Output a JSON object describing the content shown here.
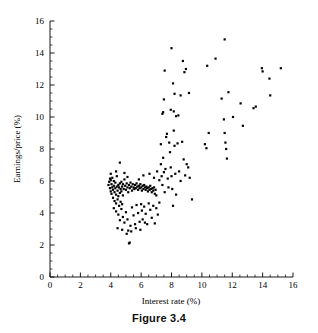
{
  "caption": "Figure 3.4",
  "chart_data": {
    "type": "scatter",
    "title": "",
    "xlabel": "Interest rate (%)",
    "ylabel": "Earnings/price (%)",
    "xlim": [
      0,
      16
    ],
    "ylim": [
      0,
      16
    ],
    "xticks": [
      0,
      2,
      4,
      6,
      8,
      10,
      12,
      14,
      16
    ],
    "yticks": [
      0,
      2,
      4,
      6,
      8,
      10,
      12,
      14,
      16
    ],
    "xtick_labels": [
      "0",
      "2",
      "4",
      "6",
      "8",
      "10",
      "12",
      "14",
      "16"
    ],
    "ytick_labels": [
      "0",
      "2",
      "4",
      "6",
      "8",
      "10",
      "12",
      "14",
      "16"
    ],
    "minor_tick_step": 0.5,
    "grid": false,
    "legend": false,
    "marker": "filled-square",
    "marker_color": "#000000",
    "marker_size_px": 2.2,
    "n_points": 198,
    "points": [
      [
        3.85,
        5.75
      ],
      [
        3.9,
        5.95
      ],
      [
        3.95,
        6.15
      ],
      [
        3.95,
        5.55
      ],
      [
        4.0,
        5.35
      ],
      [
        4.0,
        6.05
      ],
      [
        4.05,
        5.8
      ],
      [
        4.05,
        5.2
      ],
      [
        4.1,
        5.6
      ],
      [
        4.1,
        6.2
      ],
      [
        4.15,
        5.45
      ],
      [
        4.15,
        4.95
      ],
      [
        4.2,
        5.7
      ],
      [
        4.2,
        6.0
      ],
      [
        4.25,
        5.3
      ],
      [
        4.25,
        4.75
      ],
      [
        4.3,
        5.55
      ],
      [
        4.3,
        5.9
      ],
      [
        4.35,
        5.15
      ],
      [
        4.35,
        4.6
      ],
      [
        4.4,
        5.65
      ],
      [
        4.4,
        6.3
      ],
      [
        4.45,
        5.4
      ],
      [
        4.45,
        4.85
      ],
      [
        4.5,
        5.75
      ],
      [
        4.5,
        5.05
      ],
      [
        4.55,
        5.6
      ],
      [
        4.55,
        4.45
      ],
      [
        4.6,
        5.85
      ],
      [
        4.6,
        5.25
      ],
      [
        4.65,
        5.5
      ],
      [
        4.65,
        4.7
      ],
      [
        4.7,
        5.95
      ],
      [
        4.7,
        5.35
      ],
      [
        4.75,
        5.65
      ],
      [
        4.75,
        4.55
      ],
      [
        4.8,
        5.8
      ],
      [
        4.8,
        5.1
      ],
      [
        4.85,
        5.5
      ],
      [
        4.9,
        6.1
      ],
      [
        4.95,
        5.7
      ],
      [
        5.0,
        5.45
      ],
      [
        5.05,
        5.85
      ],
      [
        5.1,
        5.6
      ],
      [
        5.15,
        5.3
      ],
      [
        5.2,
        5.75
      ],
      [
        5.25,
        5.55
      ],
      [
        5.3,
        5.9
      ],
      [
        5.35,
        5.65
      ],
      [
        5.4,
        5.4
      ],
      [
        5.45,
        5.8
      ],
      [
        5.5,
        5.6
      ],
      [
        5.55,
        5.5
      ],
      [
        5.6,
        5.75
      ],
      [
        5.65,
        5.55
      ],
      [
        5.7,
        5.85
      ],
      [
        5.75,
        5.65
      ],
      [
        5.8,
        5.45
      ],
      [
        5.85,
        5.7
      ],
      [
        5.9,
        5.55
      ],
      [
        5.95,
        5.8
      ],
      [
        6.0,
        5.6
      ],
      [
        6.05,
        5.4
      ],
      [
        6.1,
        5.7
      ],
      [
        6.15,
        5.5
      ],
      [
        6.2,
        5.75
      ],
      [
        6.25,
        5.6
      ],
      [
        6.3,
        5.45
      ],
      [
        6.35,
        5.65
      ],
      [
        6.4,
        5.55
      ],
      [
        6.45,
        5.35
      ],
      [
        6.5,
        5.6
      ],
      [
        6.55,
        5.45
      ],
      [
        6.6,
        5.7
      ],
      [
        6.65,
        5.5
      ],
      [
        6.7,
        5.3
      ],
      [
        6.75,
        5.55
      ],
      [
        6.8,
        5.4
      ],
      [
        6.85,
        5.6
      ],
      [
        6.9,
        5.2
      ],
      [
        6.95,
        5.45
      ],
      [
        7.0,
        5.1
      ],
      [
        4.2,
        4.3
      ],
      [
        4.35,
        4.1
      ],
      [
        4.5,
        3.9
      ],
      [
        4.6,
        3.55
      ],
      [
        4.7,
        4.25
      ],
      [
        4.8,
        3.75
      ],
      [
        4.9,
        3.4
      ],
      [
        5.0,
        4.05
      ],
      [
        5.1,
        3.6
      ],
      [
        5.15,
        2.9
      ],
      [
        5.2,
        2.1
      ],
      [
        5.25,
        2.15
      ],
      [
        5.3,
        3.2
      ],
      [
        5.4,
        4.35
      ],
      [
        5.5,
        3.85
      ],
      [
        5.6,
        3.3
      ],
      [
        5.7,
        4.5
      ],
      [
        5.8,
        4.0
      ],
      [
        5.9,
        3.45
      ],
      [
        6.0,
        4.55
      ],
      [
        6.05,
        4.15
      ],
      [
        6.1,
        3.6
      ],
      [
        6.2,
        4.4
      ],
      [
        6.3,
        3.95
      ],
      [
        6.4,
        3.3
      ],
      [
        6.5,
        4.6
      ],
      [
        6.6,
        4.2
      ],
      [
        6.7,
        3.7
      ],
      [
        6.8,
        4.45
      ],
      [
        6.9,
        3.35
      ],
      [
        7.0,
        4.3
      ],
      [
        7.1,
        3.9
      ],
      [
        7.2,
        4.65
      ],
      [
        4.45,
        3.05
      ],
      [
        4.75,
        2.95
      ],
      [
        5.05,
        2.7
      ],
      [
        5.35,
        2.85
      ],
      [
        5.65,
        3.05
      ],
      [
        5.95,
        2.95
      ],
      [
        6.25,
        3.4
      ],
      [
        4.6,
        7.15
      ],
      [
        4.35,
        6.6
      ],
      [
        4.0,
        6.45
      ],
      [
        4.9,
        6.5
      ],
      [
        5.1,
        6.25
      ],
      [
        5.85,
        6.1
      ],
      [
        6.15,
        6.35
      ],
      [
        6.55,
        6.45
      ],
      [
        6.85,
        6.2
      ],
      [
        7.05,
        6.6
      ],
      [
        7.2,
        6.05
      ],
      [
        7.3,
        7.05
      ],
      [
        7.35,
        6.3
      ],
      [
        7.4,
        5.75
      ],
      [
        7.45,
        7.45
      ],
      [
        7.5,
        6.55
      ],
      [
        7.55,
        5.3
      ],
      [
        7.6,
        6.75
      ],
      [
        7.65,
        8.75
      ],
      [
        7.7,
        8.95
      ],
      [
        7.75,
        6.15
      ],
      [
        7.8,
        5.6
      ],
      [
        7.85,
        8.4
      ],
      [
        7.9,
        7.8
      ],
      [
        7.95,
        6.85
      ],
      [
        8.0,
        6.3
      ],
      [
        8.05,
        5.5
      ],
      [
        8.1,
        4.45
      ],
      [
        8.15,
        9.15
      ],
      [
        8.2,
        8.2
      ],
      [
        8.25,
        6.45
      ],
      [
        8.3,
        5.15
      ],
      [
        8.4,
        8.35
      ],
      [
        8.5,
        6.6
      ],
      [
        8.6,
        6.0
      ],
      [
        8.7,
        8.45
      ],
      [
        8.8,
        7.35
      ],
      [
        8.9,
        6.35
      ],
      [
        9.0,
        7.05
      ],
      [
        9.1,
        6.85
      ],
      [
        9.2,
        6.2
      ],
      [
        9.35,
        4.85
      ],
      [
        7.3,
        8.3
      ],
      [
        7.4,
        10.2
      ],
      [
        7.45,
        10.3
      ],
      [
        7.5,
        11.1
      ],
      [
        7.55,
        12.9
      ],
      [
        7.95,
        10.45
      ],
      [
        8.0,
        14.3
      ],
      [
        8.1,
        12.1
      ],
      [
        8.15,
        10.35
      ],
      [
        8.2,
        11.45
      ],
      [
        8.3,
        10.05
      ],
      [
        8.45,
        10.1
      ],
      [
        8.6,
        11.35
      ],
      [
        8.75,
        13.5
      ],
      [
        8.85,
        12.8
      ],
      [
        8.95,
        13.0
      ],
      [
        9.15,
        11.5
      ],
      [
        10.2,
        8.3
      ],
      [
        10.3,
        8.05
      ],
      [
        10.35,
        13.2
      ],
      [
        10.45,
        9.0
      ],
      [
        10.9,
        13.65
      ],
      [
        11.3,
        11.15
      ],
      [
        11.45,
        9.85
      ],
      [
        11.5,
        9.0
      ],
      [
        11.55,
        8.4
      ],
      [
        11.6,
        8.0
      ],
      [
        11.65,
        7.4
      ],
      [
        11.5,
        14.85
      ],
      [
        11.75,
        11.55
      ],
      [
        12.05,
        10.0
      ],
      [
        12.55,
        10.85
      ],
      [
        12.7,
        9.45
      ],
      [
        13.4,
        10.55
      ],
      [
        13.55,
        10.65
      ],
      [
        13.95,
        13.05
      ],
      [
        14.0,
        12.85
      ],
      [
        14.45,
        12.4
      ],
      [
        14.5,
        11.35
      ],
      [
        15.2,
        13.05
      ]
    ]
  }
}
